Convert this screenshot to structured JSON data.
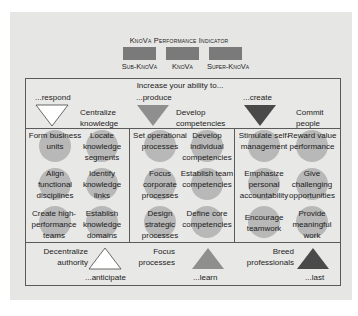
{
  "header": {
    "title": "KnoVa Performance Indicator",
    "legend": [
      {
        "label": "Sub-KnoVa",
        "color": "#7a7a7a"
      },
      {
        "label": "KnoVa",
        "color": "#7a7a7a"
      },
      {
        "label": "Super-KnoVa",
        "color": "#7a7a7a"
      }
    ]
  },
  "top": {
    "heading": "Increase your ability to...",
    "columns": [
      {
        "verb": "...respond",
        "action": "Centralize knowledge",
        "triangle_color": "#ffffff"
      },
      {
        "verb": "...produce",
        "action": "Develop competencies",
        "triangle_color": "#8f8f8f"
      },
      {
        "verb": "...create",
        "action": "Commit people",
        "triangle_color": "#4a4a4a"
      }
    ]
  },
  "grid": {
    "columns": [
      {
        "cells": [
          [
            "Form business units",
            "Locate knowledge segments"
          ],
          [
            "Align functional disciplines",
            "Identify knowledge links"
          ],
          [
            "Create high-performance teams",
            "Establish knowledge domains"
          ]
        ]
      },
      {
        "cells": [
          [
            "Set operational processes",
            "Develop individual competencies"
          ],
          [
            "Focus corporate processes",
            "Establish team competencies"
          ],
          [
            "Design strategic processes",
            "Define core competencies"
          ]
        ]
      },
      {
        "cells": [
          [
            "Stimulate self-management",
            "Reward value performance"
          ],
          [
            "Emphasize personal accountability",
            "Give challenging opportunities"
          ],
          [
            "Encourage teamwork",
            "Provide meaningful work"
          ]
        ]
      }
    ]
  },
  "bottom": {
    "columns": [
      {
        "action": "Decentralize authority",
        "verb": "...anticipate",
        "triangle_color": "#ffffff"
      },
      {
        "action": "Focus processes",
        "verb": "...learn",
        "triangle_color": "#8f8f8f"
      },
      {
        "action": "Breed professionals",
        "verb": "...last",
        "triangle_color": "#4a4a4a"
      }
    ]
  }
}
